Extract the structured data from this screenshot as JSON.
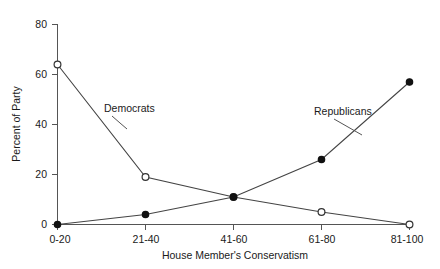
{
  "chart_data": {
    "type": "line",
    "title": "",
    "subtitle": "",
    "xlabel": "House Member's Conservatism",
    "ylabel": "Percent of Party",
    "categories": [
      "0-20",
      "21-40",
      "41-60",
      "61-80",
      "81-100"
    ],
    "xlim": [
      0,
      4
    ],
    "ylim": [
      0,
      80
    ],
    "yticks": [
      0,
      20,
      40,
      60,
      80
    ],
    "ytick_labels": [
      "0",
      "20",
      "40",
      "60",
      "80"
    ],
    "grid": false,
    "legend_position": "inline-annotations",
    "series": [
      {
        "name": "Democrats",
        "marker": "open-circle",
        "values": [
          64,
          19,
          11,
          5,
          0
        ]
      },
      {
        "name": "Republicans",
        "marker": "filled-circle",
        "values": [
          0,
          4,
          11,
          26,
          57
        ]
      }
    ],
    "annotations": [
      {
        "text": "Democrats",
        "series": "Democrats"
      },
      {
        "text": "Republicans",
        "series": "Republicans"
      }
    ]
  },
  "colors": {
    "background": "#ffffff",
    "axis": "#555555",
    "line": "#444444",
    "marker_open_fill": "#ffffff",
    "marker_filled_fill": "#111111",
    "text": "#1a1a1a"
  }
}
